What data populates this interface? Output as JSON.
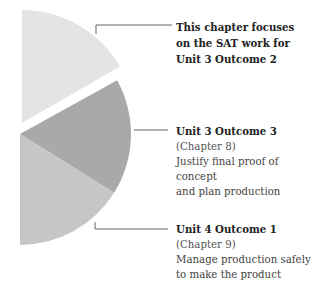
{
  "diagram": {
    "type": "partial-pie",
    "segments": [
      {
        "id": "unit3-outcome2",
        "title_lines": [
          "This chapter focuses",
          "on the SAT work for",
          "Unit 3 Outcome 2"
        ],
        "color": "#e4e4e4",
        "exploded": true
      },
      {
        "id": "unit3-outcome3",
        "title": "Unit 3 Outcome 3",
        "chapter": "(Chapter 8)",
        "description_lines": [
          "Justify final proof of concept",
          "and plan production"
        ],
        "color": "#a9a9a9"
      },
      {
        "id": "unit4-outcome1",
        "title": "Unit 4 Outcome 1",
        "chapter": "(Chapter 9)",
        "description_lines": [
          "Manage production safely",
          "to make the product"
        ],
        "color": "#c6c6c6"
      }
    ],
    "leader_color": "#666666"
  }
}
